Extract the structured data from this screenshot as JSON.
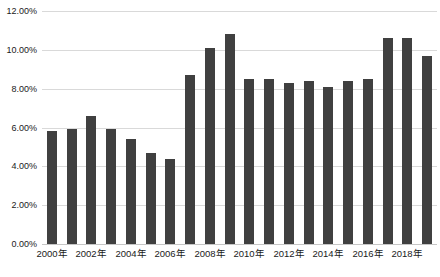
{
  "chart_data": {
    "type": "bar",
    "title": "",
    "xlabel": "",
    "ylabel": "",
    "categories": [
      "2000年",
      "2001年",
      "2002年",
      "2003年",
      "2004年",
      "2005年",
      "2006年",
      "2007年",
      "2008年",
      "2009年",
      "2010年",
      "2011年",
      "2012年",
      "2013年",
      "2014年",
      "2015年",
      "2016年",
      "2017年",
      "2018年",
      "2019年"
    ],
    "values": [
      5.8,
      5.9,
      6.6,
      5.9,
      5.4,
      4.7,
      4.4,
      8.7,
      10.1,
      10.8,
      8.5,
      8.5,
      8.3,
      8.4,
      8.1,
      8.4,
      8.5,
      10.6,
      10.6,
      9.7
    ],
    "x_tick_labels": [
      "2000年",
      "2002年",
      "2004年",
      "2006年",
      "2008年",
      "2010年",
      "2012年",
      "2014年",
      "2016年",
      "2018年"
    ],
    "x_tick_every": 2,
    "y_tick_labels": [
      "0.00%",
      "2.00%",
      "4.00%",
      "6.00%",
      "8.00%",
      "10.00%",
      "12.00%"
    ],
    "y_ticks": [
      0,
      2,
      4,
      6,
      8,
      10,
      12
    ],
    "ylim": [
      0,
      12
    ],
    "grid": true,
    "legend": "none",
    "colors": {
      "bar": "#404040",
      "gridline": "#d9d9d9",
      "axis_line": "#c6c6c6",
      "text": "#1a1a1a",
      "background": "#ffffff"
    }
  }
}
